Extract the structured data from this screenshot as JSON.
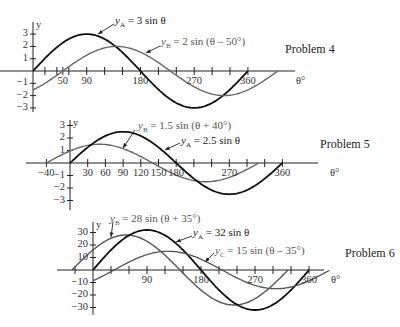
{
  "chart_data": [
    {
      "type": "line",
      "title": "Problem 4",
      "xlabel": "θ°",
      "ylabel": "y",
      "xticks": [
        50,
        90,
        180,
        270,
        360
      ],
      "yticks": [
        3,
        2,
        1,
        -1,
        -2,
        -3
      ],
      "ylim": [
        -3,
        3
      ],
      "series": [
        {
          "name": "y_A = 3 sin θ",
          "amplitude": 3,
          "phase_deg": 0,
          "x_range": [
            0,
            360
          ]
        },
        {
          "name": "y_B = 2 sin (θ – 50°)",
          "amplitude": 2,
          "phase_deg": -50,
          "x_range": [
            0,
            410
          ]
        }
      ]
    },
    {
      "type": "line",
      "title": "Problem 5",
      "xlabel": "θ°",
      "ylabel": "y",
      "xticks": [
        -40,
        30,
        60,
        90,
        120,
        150,
        180,
        270,
        360
      ],
      "yticks": [
        3,
        2,
        1,
        -1,
        -2,
        -3
      ],
      "ylim": [
        -3,
        3
      ],
      "series": [
        {
          "name": "y_B = 1.5 sin (θ + 40°)",
          "amplitude": 1.5,
          "phase_deg": 40,
          "x_range": [
            -40,
            320
          ]
        },
        {
          "name": "y_A = 2.5 sin θ",
          "amplitude": 2.5,
          "phase_deg": 0,
          "x_range": [
            0,
            360
          ]
        }
      ]
    },
    {
      "type": "line",
      "title": "Problem 6",
      "xlabel": "θ°",
      "ylabel": "y",
      "xticks": [
        90,
        180,
        270,
        360
      ],
      "yticks": [
        30,
        20,
        10,
        -10,
        -20,
        -30
      ],
      "ylim": [
        -30,
        30
      ],
      "series": [
        {
          "name": "y_B = 28 sin (θ + 35°)",
          "amplitude": 28,
          "phase_deg": 35,
          "x_range": [
            -35,
            325
          ]
        },
        {
          "name": "y_A = 32 sin θ",
          "amplitude": 32,
          "phase_deg": 0,
          "x_range": [
            0,
            360
          ]
        },
        {
          "name": "y_C = 15 sin (θ – 35°)",
          "amplitude": 15,
          "phase_deg": -35,
          "x_range": [
            0,
            395
          ]
        }
      ]
    }
  ],
  "labels": {
    "p4": {
      "title": "Problem 4",
      "a": "= 3 sin θ",
      "b": "= 2 sin (θ – 50°)"
    },
    "p5": {
      "title": "Problem 5",
      "a": "= 2.5 sin θ",
      "b": "= 1.5 sin (θ + 40°)"
    },
    "p6": {
      "title": "Problem 6",
      "a": "= 32 sin θ",
      "b": "= 28 sin (θ + 35°)",
      "c": "= 15 sin (θ – 35°)"
    },
    "theta": "θ°",
    "y": "y"
  }
}
